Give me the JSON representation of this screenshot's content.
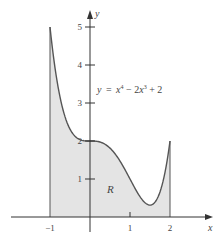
{
  "chart_data": {
    "type": "area",
    "title": "",
    "xlabel": "x",
    "ylabel": "y",
    "function": "y = x^4 - 2x^3 + 2",
    "equation_label": {
      "y": "y",
      "eq": "=",
      "x4": "x",
      "p4": "4",
      "minus": " − 2",
      "x3": "x",
      "p3": "3",
      "plus": " + 2"
    },
    "region_label": "R",
    "shaded_interval": [
      -1,
      2
    ],
    "xlim": [
      -1.45,
      3.0
    ],
    "ylim": [
      0,
      5.3
    ],
    "x_ticks": [
      -1,
      0,
      1,
      2
    ],
    "x_tick_labels": [
      "−1",
      "",
      "1",
      "2"
    ],
    "y_ticks": [
      1,
      2,
      3,
      4,
      5
    ],
    "y_tick_labels": [
      "1",
      "2",
      "3",
      "4",
      "5"
    ],
    "x": [
      -1,
      -0.75,
      -0.5,
      -0.25,
      0,
      0.25,
      0.5,
      0.75,
      1,
      1.25,
      1.5,
      1.75,
      2
    ],
    "values": [
      5,
      3.16,
      2.31,
      2.04,
      2,
      1.97,
      1.81,
      1.47,
      1,
      0.53,
      0.31,
      0.66,
      2
    ],
    "grid": false,
    "colors": {
      "fill": "#e4e4e4",
      "curve": "#555555",
      "axis": "#333333"
    }
  }
}
